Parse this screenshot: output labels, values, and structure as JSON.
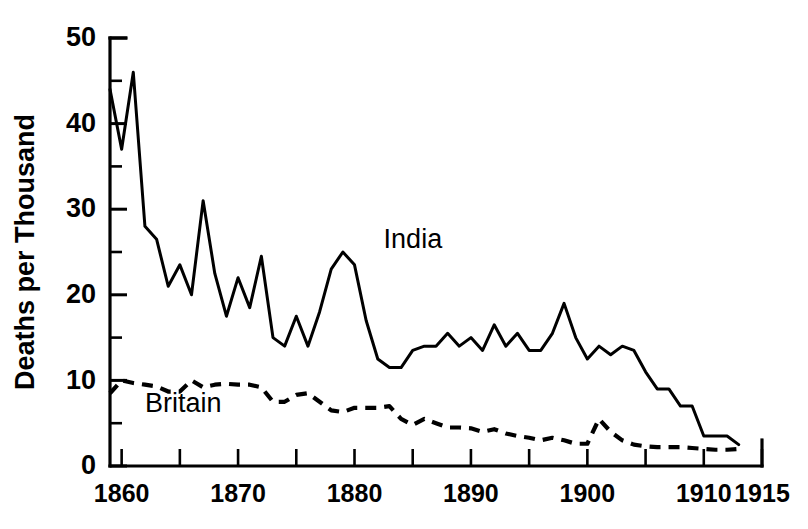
{
  "chart_data": {
    "type": "line",
    "title": "",
    "xlabel": "",
    "ylabel": "Deaths per Thousand",
    "xlim": [
      1859,
      1915
    ],
    "ylim": [
      0,
      50
    ],
    "grid": false,
    "legend_position": "inline-annotation",
    "y_ticks_major": [
      0,
      10,
      20,
      30,
      40,
      50
    ],
    "y_ticks_minor": [
      5,
      15,
      25,
      35,
      45
    ],
    "y_tick_labels": [
      "0",
      "10",
      "20",
      "30",
      "40",
      "50"
    ],
    "x_ticks": [
      1860,
      1865,
      1870,
      1875,
      1880,
      1885,
      1890,
      1895,
      1900,
      1905,
      1910,
      1915
    ],
    "x_tick_labels_shown": [
      "1860",
      "1870",
      "1880",
      "1890",
      "1900",
      "1910",
      "1915"
    ],
    "x_tick_labels_shown_years": [
      1860,
      1870,
      1880,
      1890,
      1900,
      1910,
      1915
    ],
    "annotations": [
      {
        "text": "India",
        "x": 1882.5,
        "y": 25.5
      },
      {
        "text": "Britain",
        "x": 1862.0,
        "y": 6.3
      }
    ],
    "series": [
      {
        "name": "India",
        "style": "solid",
        "color": "#000000",
        "x": [
          1859,
          1860,
          1861,
          1862,
          1863,
          1864,
          1865,
          1866,
          1867,
          1868,
          1869,
          1870,
          1871,
          1872,
          1873,
          1874,
          1875,
          1876,
          1877,
          1878,
          1879,
          1880,
          1881,
          1882,
          1883,
          1884,
          1885,
          1886,
          1887,
          1888,
          1889,
          1890,
          1891,
          1892,
          1893,
          1894,
          1895,
          1896,
          1897,
          1898,
          1899,
          1900,
          1901,
          1902,
          1903,
          1904,
          1905,
          1906,
          1907,
          1908,
          1909,
          1910,
          1911,
          1912,
          1913
        ],
        "values": [
          44.0,
          37.0,
          46.0,
          28.0,
          26.5,
          21.0,
          23.5,
          20.0,
          31.0,
          22.5,
          17.5,
          22.0,
          18.5,
          24.5,
          15.0,
          14.0,
          17.5,
          14.0,
          18.0,
          23.0,
          25.0,
          23.5,
          17.0,
          12.5,
          11.5,
          11.5,
          13.5,
          14.0,
          14.0,
          15.5,
          14.0,
          15.0,
          13.5,
          16.5,
          14.0,
          15.5,
          13.5,
          13.5,
          15.5,
          19.0,
          15.0,
          12.5,
          14.0,
          13.0,
          14.0,
          13.5,
          11.0,
          9.0,
          9.0,
          7.0,
          7.0,
          3.5,
          3.5,
          3.5,
          2.5
        ]
      },
      {
        "name": "Britain",
        "style": "dashed",
        "color": "#000000",
        "x": [
          1859,
          1860,
          1861,
          1862,
          1863,
          1864,
          1865,
          1866,
          1867,
          1868,
          1869,
          1870,
          1871,
          1872,
          1873,
          1874,
          1875,
          1876,
          1877,
          1878,
          1879,
          1880,
          1881,
          1882,
          1883,
          1884,
          1885,
          1886,
          1887,
          1888,
          1889,
          1890,
          1891,
          1892,
          1893,
          1894,
          1895,
          1896,
          1897,
          1898,
          1899,
          1900,
          1901,
          1902,
          1903,
          1904,
          1905,
          1906,
          1907,
          1908,
          1909,
          1910,
          1911,
          1912,
          1913
        ],
        "values": [
          8.5,
          10.0,
          9.7,
          9.5,
          9.3,
          8.7,
          8.7,
          10.0,
          9.2,
          9.5,
          9.6,
          9.5,
          9.5,
          9.2,
          7.5,
          7.5,
          8.3,
          8.5,
          7.5,
          6.5,
          6.3,
          6.8,
          6.8,
          6.8,
          7.0,
          5.5,
          4.8,
          5.5,
          5.0,
          4.5,
          4.5,
          4.4,
          4.0,
          4.3,
          3.8,
          3.5,
          3.3,
          3.0,
          3.3,
          3.0,
          2.6,
          2.6,
          5.5,
          4.0,
          3.0,
          2.5,
          2.3,
          2.2,
          2.2,
          2.2,
          2.1,
          2.0,
          1.9,
          1.9,
          2.0
        ]
      }
    ]
  },
  "axes": {
    "y_title": "Deaths per Thousand"
  },
  "labels": {
    "india": "India",
    "britain": "Britain"
  }
}
